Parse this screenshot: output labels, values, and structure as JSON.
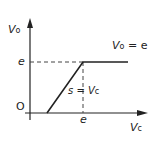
{
  "diagram": {
    "y_axis_label": "V",
    "y_axis_sub": "o",
    "x_axis_label": "V",
    "x_axis_sub": "c",
    "origin_label": "O",
    "y_tick_label": "e",
    "x_tick_label": "e",
    "curve_label": "V",
    "curve_label_sub": "o",
    "curve_label_rest": " = e",
    "slope_label": "s = ",
    "slope_label_v": "V",
    "slope_label_sub": "c"
  },
  "colors": {
    "line": "#222222",
    "background": "#ffffff"
  }
}
